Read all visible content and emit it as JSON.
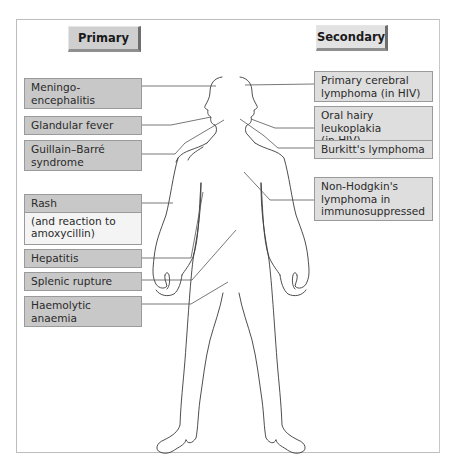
{
  "diagram": {
    "type": "body-map",
    "headers": {
      "primary": "Primary",
      "secondary": "Secondary"
    },
    "primary_labels": [
      {
        "text": "Meningo-encephalitis",
        "site": "brain"
      },
      {
        "text": "Glandular fever",
        "site": "neck/throat"
      },
      {
        "text": "Guillain–Barré syndrome",
        "site": "nerves/shoulder"
      },
      {
        "text": "Rash",
        "subtext": "(and reaction to amoxycillin)",
        "site": "skin/arm"
      },
      {
        "text": "Hepatitis",
        "site": "liver"
      },
      {
        "text": "Splenic rupture",
        "site": "spleen"
      },
      {
        "text": "Haemolytic anaemia",
        "site": "blood/pelvis"
      }
    ],
    "secondary_labels": [
      {
        "text": "Primary cerebral lymphoma (in HIV)",
        "site": "brain"
      },
      {
        "text": "Oral hairy leukoplakia (in HIV)",
        "site": "mouth"
      },
      {
        "text": "Burkitt's lymphoma",
        "site": "jaw/shoulder"
      },
      {
        "text": "Non-Hodgkin's lymphoma in immunosuppressed",
        "site": "lymph nodes/trunk"
      }
    ],
    "colors": {
      "primary_box": "#c8c8c8",
      "secondary_box": "#dedede",
      "rash_sub_box": "#f4f4f4",
      "outline": "#3a3a3a",
      "leader": "#555555"
    }
  },
  "ui": {
    "labels": {
      "p0": "Meningo-encephalitis",
      "p1": "Glandular fever",
      "p2a": "Guillain–Barré",
      "p2b": "syndrome",
      "p3": "Rash",
      "p3b1": "(and reaction to",
      "p3b2": "amoxycillin)",
      "p4": "Hepatitis",
      "p5": "Splenic rupture",
      "p6": "Haemolytic anaemia",
      "s0a": "Primary cerebral",
      "s0b": "lymphoma (in HIV)",
      "s1a": "Oral hairy leukoplakia",
      "s1b": "(in HIV)",
      "s2": "Burkitt's lymphoma",
      "s3a": "Non-Hodgkin's",
      "s3b": "lymphoma in",
      "s3c": "immunosuppressed"
    }
  }
}
